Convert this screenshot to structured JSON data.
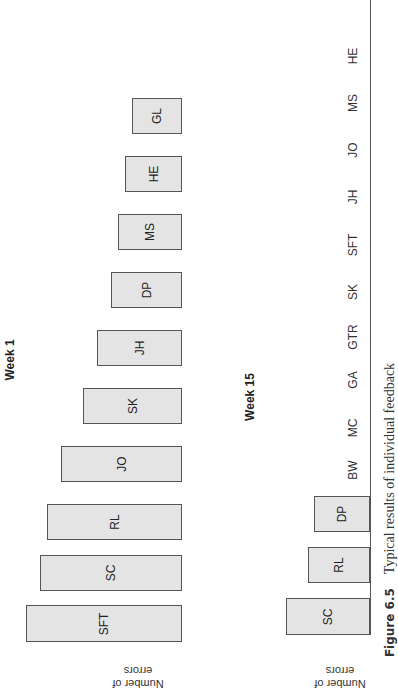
{
  "figure": {
    "number": "Figure 6.5",
    "caption": "Typical results of individual feedback"
  },
  "chart_data": [
    {
      "type": "bar",
      "orientation": "rotated (horizontal in image, page rotated 90°)",
      "title": "Week 1",
      "ylabel": "Number of errors",
      "xlabel": "",
      "categories": [
        "SFT",
        "SC",
        "RL",
        "JO",
        "SK",
        "JH",
        "DP",
        "MS",
        "HE",
        "GL"
      ],
      "values": [
        22,
        20,
        19,
        17,
        14,
        12,
        10,
        9,
        8,
        7
      ],
      "value_units": "relative (no axis scale shown)",
      "bar_labels_inside": true,
      "grid": false,
      "legend": null
    },
    {
      "type": "bar",
      "orientation": "rotated (horizontal in image, page rotated 90°)",
      "title": "Week 15",
      "ylabel": "Number of errors",
      "xlabel": "",
      "categories": [
        "SC",
        "RL",
        "DP",
        "BW",
        "MC",
        "GA",
        "GTR",
        "SK",
        "SFT",
        "JH",
        "JO",
        "MS",
        "HE"
      ],
      "values": [
        12,
        9,
        8,
        0,
        0,
        0,
        0,
        0,
        0,
        0,
        0,
        0,
        0
      ],
      "value_units": "relative (no axis scale shown)",
      "bar_labels_inside": true,
      "grid": false,
      "legend": null
    }
  ],
  "week1": {
    "title": "Week 1",
    "ylabel_line1": "Number of",
    "ylabel_line2": "errors",
    "bars": [
      {
        "label": "SFT",
        "left": 26,
        "top": 605,
        "width": 156,
        "height": 37
      },
      {
        "label": "SC",
        "left": 40,
        "top": 555,
        "width": 142,
        "height": 36
      },
      {
        "label": "RL",
        "left": 47,
        "top": 504,
        "width": 135,
        "height": 36
      },
      {
        "label": "JO",
        "left": 61,
        "top": 446,
        "width": 121,
        "height": 36
      },
      {
        "label": "SK",
        "left": 83,
        "top": 388,
        "width": 99,
        "height": 36
      },
      {
        "label": "JH",
        "left": 97,
        "top": 330,
        "width": 85,
        "height": 36
      },
      {
        "label": "DP",
        "left": 111,
        "top": 272,
        "width": 71,
        "height": 36
      },
      {
        "label": "MS",
        "left": 118,
        "top": 214,
        "width": 64,
        "height": 36
      },
      {
        "label": "HE",
        "left": 125,
        "top": 156,
        "width": 57,
        "height": 36
      },
      {
        "label": "GL",
        "left": 132,
        "top": 98,
        "width": 50,
        "height": 36
      }
    ]
  },
  "week15": {
    "title": "Week 15",
    "ylabel_line1": "Number of",
    "ylabel_line2": "errors",
    "bars": [
      {
        "label": "SC",
        "left": 286,
        "top": 598,
        "width": 84,
        "height": 37
      },
      {
        "label": "RL",
        "left": 308,
        "top": 547,
        "width": 62,
        "height": 36
      },
      {
        "label": "DP",
        "left": 314,
        "top": 496,
        "width": 56,
        "height": 36
      }
    ],
    "zero_labels": [
      {
        "label": "BW",
        "y": 470
      },
      {
        "label": "MC",
        "y": 428
      },
      {
        "label": "GA",
        "y": 380
      },
      {
        "label": "GTR",
        "y": 337
      },
      {
        "label": "SK",
        "y": 292
      },
      {
        "label": "SFT",
        "y": 245
      },
      {
        "label": "JH",
        "y": 197
      },
      {
        "label": "JO",
        "y": 150
      },
      {
        "label": "MS",
        "y": 103
      },
      {
        "label": "HE",
        "y": 56
      }
    ]
  }
}
